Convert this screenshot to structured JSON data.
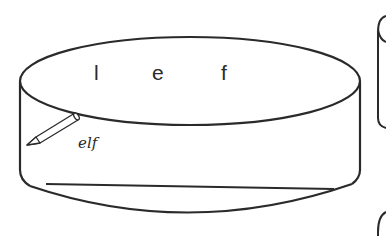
{
  "diagram": {
    "type": "cylinder-disk",
    "top_letters": [
      {
        "text": "l",
        "x": 98,
        "y": 80
      },
      {
        "text": "e",
        "x": 160,
        "y": 80
      },
      {
        "text": "f",
        "x": 227,
        "y": 80
      }
    ],
    "pencil": {
      "icon": "pencil-icon",
      "written_word": "elf"
    },
    "colors": {
      "stroke": "#2a2a2a",
      "background": "#ffffff"
    }
  }
}
